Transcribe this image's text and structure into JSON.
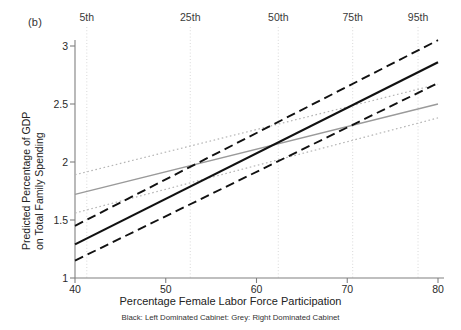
{
  "panel": {
    "label": "(b)"
  },
  "axes": {
    "ylabel_line1": "Predicted Percentage of GDP",
    "ylabel_line2": "on Total Family Spending",
    "xlabel": "Percentage Female Labor Force Participation",
    "caption": "Black: Left Dominated Cabinet: Grey: Right Dominated Cabinet",
    "yticks": [
      "1",
      "1.5",
      "2",
      "2.5",
      "3"
    ],
    "xticks": [
      "40",
      "50",
      "60",
      "70",
      "80"
    ]
  },
  "percentile_markers": [
    {
      "label": "5th",
      "x": 41.3
    },
    {
      "label": "25th",
      "x": 52.7
    },
    {
      "label": "50th",
      "x": 62.4
    },
    {
      "label": "75th",
      "x": 70.6
    },
    {
      "label": "95th",
      "x": 77.8
    }
  ],
  "colors": {
    "black": "#111111",
    "grey": "#9a9a9a",
    "grey_ci": "#b5b5b5",
    "gridline": "#d8d8d8",
    "axis": "#808080"
  },
  "chart_data": {
    "type": "line",
    "title": "",
    "xlabel": "Percentage Female Labor Force Participation",
    "ylabel": "Predicted Percentage of GDP on Total Family Spending",
    "annotation": "Black: Left Dominated Cabinet: Grey: Right Dominated Cabinet",
    "panel_label": "(b)",
    "xlim": [
      40,
      80
    ],
    "ylim": [
      1,
      3.15
    ],
    "grid": false,
    "legend_position": "below-as-caption",
    "vertical_reference_lines": [
      {
        "label": "5th",
        "x": 41.3
      },
      {
        "label": "25th",
        "x": 52.7
      },
      {
        "label": "50th",
        "x": 62.4
      },
      {
        "label": "75th",
        "x": 70.6
      },
      {
        "label": "95th",
        "x": 77.8
      }
    ],
    "x": [
      40,
      80
    ],
    "series": [
      {
        "name": "Left Dominated Cabinet (fit)",
        "group": "black",
        "style": "solid",
        "color": "#111111",
        "width": 2.2,
        "values": [
          1.29,
          2.86
        ]
      },
      {
        "name": "Left Dominated Cabinet (upper CI)",
        "group": "black",
        "style": "dashed",
        "color": "#111111",
        "width": 1.9,
        "values": [
          1.45,
          3.05
        ]
      },
      {
        "name": "Left Dominated Cabinet (lower CI)",
        "group": "black",
        "style": "dashed",
        "color": "#111111",
        "width": 1.9,
        "values": [
          1.15,
          2.68
        ]
      },
      {
        "name": "Right Dominated Cabinet (fit)",
        "group": "grey",
        "style": "solid",
        "color": "#9a9a9a",
        "width": 1.3,
        "values": [
          1.72,
          2.5
        ]
      },
      {
        "name": "Right Dominated Cabinet (upper CI)",
        "group": "grey",
        "style": "dotted",
        "color": "#b5b5b5",
        "width": 1.2,
        "values": [
          1.89,
          2.67
        ]
      },
      {
        "name": "Right Dominated Cabinet (lower CI)",
        "group": "grey",
        "style": "dotted",
        "color": "#b5b5b5",
        "width": 1.2,
        "values": [
          1.56,
          2.38
        ]
      }
    ]
  }
}
